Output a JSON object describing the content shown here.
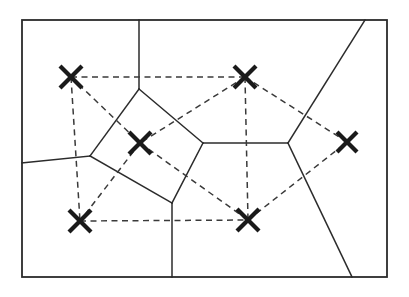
{
  "figure": {
    "canvas_width": 409,
    "canvas_height": 297,
    "background_color": "#ffffff",
    "line_color": "#2b2b2b",
    "dashed_color": "#3a3a3a",
    "marker_color": "#1a1a1a"
  },
  "frame": {
    "name": "bounding-box",
    "x": 22,
    "y": 20,
    "width": 365,
    "height": 257,
    "stroke_width": 1.8
  },
  "sites": [
    {
      "id": "s1",
      "label": "top-left-site",
      "x": 71,
      "y": 77,
      "arm": 11
    },
    {
      "id": "s2",
      "label": "top-right-site",
      "x": 245,
      "y": 77,
      "arm": 11
    },
    {
      "id": "s3",
      "label": "center-left-site",
      "x": 140,
      "y": 143,
      "arm": 11
    },
    {
      "id": "s4",
      "label": "right-site",
      "x": 347,
      "y": 142,
      "arm": 10
    },
    {
      "id": "s5",
      "label": "bottom-left-site",
      "x": 80,
      "y": 221,
      "arm": 11
    },
    {
      "id": "s6",
      "label": "bottom-center-site",
      "x": 248,
      "y": 220,
      "arm": 11
    }
  ],
  "voronoi_vertices": [
    {
      "id": "v1",
      "label": "upper-central-vertex",
      "x": 139,
      "y": 89
    },
    {
      "id": "v2",
      "label": "left-vertex",
      "x": 90,
      "y": 156
    },
    {
      "id": "v3",
      "label": "mid-right-vertex",
      "x": 203,
      "y": 143
    },
    {
      "id": "v4",
      "label": "lower-central-vertex",
      "x": 172,
      "y": 203
    },
    {
      "id": "v5",
      "label": "right-vertex",
      "x": 288,
      "y": 143
    }
  ],
  "voronoi_edges": [
    {
      "id": "e1",
      "label": "v1-to-top-border",
      "points": "139,89 139,20"
    },
    {
      "id": "e2",
      "label": "v1-to-v2",
      "points": "139,89 90,156"
    },
    {
      "id": "e3",
      "label": "v1-to-v3",
      "points": "139,89 203,143"
    },
    {
      "id": "e4",
      "label": "v2-to-left-border",
      "points": "90,156 22,163"
    },
    {
      "id": "e5",
      "label": "v2-to-v4",
      "points": "90,156 172,203"
    },
    {
      "id": "e6",
      "label": "v3-to-v4",
      "points": "203,143 172,203"
    },
    {
      "id": "e7",
      "label": "v3-to-v5",
      "points": "203,143 288,143"
    },
    {
      "id": "e8",
      "label": "v4-to-bottom-border",
      "points": "172,203 172,277"
    },
    {
      "id": "e9",
      "label": "v5-to-top-border",
      "points": "288,143 365,20"
    },
    {
      "id": "e10",
      "label": "v5-to-bottom-border",
      "points": "288,143 352,277"
    }
  ],
  "delaunay_edges": [
    {
      "id": "d1",
      "label": "s1-to-s2",
      "points": "71,77 245,77"
    },
    {
      "id": "d2",
      "label": "s1-to-s3",
      "points": "71,77 140,143"
    },
    {
      "id": "d3",
      "label": "s1-to-s5",
      "points": "71,77 80,221"
    },
    {
      "id": "d4",
      "label": "s2-to-s3",
      "points": "245,77 140,143"
    },
    {
      "id": "d5",
      "label": "s2-to-s6",
      "points": "245,77 248,220"
    },
    {
      "id": "d6",
      "label": "s2-to-s4",
      "points": "245,77 347,142"
    },
    {
      "id": "d7",
      "label": "s3-to-s5",
      "points": "140,143 80,221"
    },
    {
      "id": "d8",
      "label": "s3-to-s6",
      "points": "140,143 248,220"
    },
    {
      "id": "d9",
      "label": "s5-to-s6",
      "points": "80,221 248,220"
    },
    {
      "id": "d10",
      "label": "s6-to-s4",
      "points": "248,220 347,142"
    }
  ]
}
